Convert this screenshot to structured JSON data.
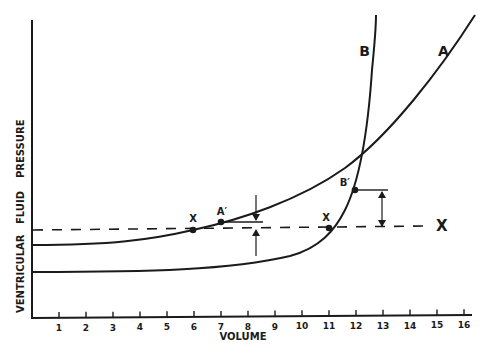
{
  "chart_data": {
    "type": "line",
    "title": "",
    "xlabel": "VOLUME",
    "ylabel": "VENTRICULAR FLUID PRESSURE",
    "ylabel_parts": [
      "VENTRICULAR",
      "FLUID",
      "PRESSURE"
    ],
    "x_ticks": [
      "1",
      "2",
      "3",
      "4",
      "5",
      "6",
      "7",
      "8",
      "9",
      "10",
      "11",
      "12",
      "13",
      "14",
      "15",
      "16"
    ],
    "xlim": [
      0,
      16.5
    ],
    "y_ticks": [],
    "grid": false,
    "legend": "none (curves labeled inline)",
    "series": [
      {
        "name": "A",
        "label": "A",
        "description": "Gradually rising exponential pressure-volume curve (compliant)",
        "x": [
          0,
          2,
          4,
          5,
          6,
          7,
          8,
          9,
          10,
          11,
          12,
          13,
          14,
          15,
          16
        ],
        "y_rel": [
          2.7,
          2.75,
          2.9,
          3.05,
          3.3,
          3.55,
          3.9,
          4.3,
          4.8,
          5.4,
          6.2,
          7.2,
          8.4,
          9.8,
          11.5
        ]
      },
      {
        "name": "B",
        "label": "B",
        "description": "Flat then steeply rising pressure-volume curve (non-compliant)",
        "x": [
          0,
          2,
          4,
          6,
          8,
          9,
          10,
          10.5,
          11,
          11.5,
          12,
          12.3,
          12.6,
          12.9,
          13.1
        ],
        "y_rel": [
          1.7,
          1.7,
          1.7,
          1.72,
          1.85,
          2.0,
          2.3,
          2.6,
          3.0,
          3.5,
          4.5,
          5.5,
          7.0,
          9.5,
          12.0
        ]
      },
      {
        "name": "X",
        "label": "X",
        "style": "dashed horizontal reference",
        "x": [
          0,
          16
        ],
        "y_rel": [
          3.2,
          3.2
        ]
      }
    ],
    "annotations": [
      {
        "text": "X",
        "x": 6,
        "on": "A ∩ X"
      },
      {
        "text": "A′",
        "x": 7,
        "on": "A"
      },
      {
        "text": "X",
        "x": 11,
        "on": "B ∩ X"
      },
      {
        "text": "B′",
        "x": 12,
        "on": "B"
      },
      {
        "text": "small pressure difference arrows",
        "x": 8.3,
        "between": "A′ and X line"
      },
      {
        "text": "large pressure difference arrow",
        "x": 13,
        "between": "B′ and X line"
      },
      {
        "text": "X",
        "x": 15,
        "note": "label at right end of dashed line"
      }
    ]
  },
  "labels": {
    "curve_a": "A",
    "curve_b": "B",
    "line_x": "X",
    "point_x1": "X",
    "point_a_prime": "A′",
    "point_x2": "X",
    "point_b_prime": "B′",
    "xlabel": "VOLUME",
    "ylabel_1": "VENTRICULAR",
    "ylabel_2": "FLUID",
    "ylabel_3": "PRESSURE"
  },
  "colors": {
    "ink": "#1a1a1a",
    "background": "#ffffff"
  }
}
